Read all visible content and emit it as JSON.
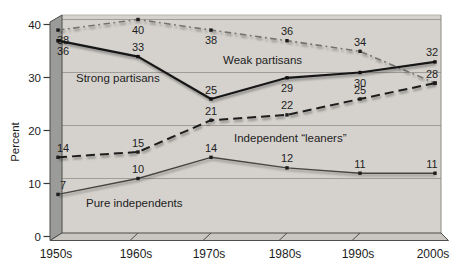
{
  "chart_data": {
    "type": "line",
    "title": "",
    "xlabel": "",
    "ylabel": "Percent",
    "categories": [
      "1950s",
      "1960s",
      "1970s",
      "1980s",
      "1990s",
      "2000s"
    ],
    "ylim": [
      0,
      40
    ],
    "yticks": [
      0,
      10,
      20,
      30,
      40
    ],
    "grid": true,
    "frame_style": "3d-textbook-panel",
    "legend_position": "inline-annotations",
    "series": [
      {
        "name": "Weak partisans",
        "style": "dash-dot",
        "color": "#72726f",
        "marker_color": "#1c1c1c",
        "values": [
          38,
          40,
          38,
          36,
          34,
          28
        ],
        "label_positions": [
          "below",
          "below",
          "below",
          "above",
          "above",
          "none"
        ]
      },
      {
        "name": "Independent “leaners”",
        "style": "dashed",
        "color": "#1f1f1d",
        "marker_color": "#1c1c1c",
        "values": [
          14,
          15,
          21,
          22,
          25,
          28
        ],
        "label_positions": [
          "above",
          "above",
          "above",
          "above",
          "above",
          "above"
        ]
      },
      {
        "name": "Pure independents",
        "style": "solid-thin",
        "color": "#454543",
        "marker_color": "#1c1c1c",
        "values": [
          7,
          10,
          14,
          12,
          11,
          11
        ],
        "label_positions": [
          "above",
          "above",
          "above",
          "above",
          "above",
          "above"
        ]
      },
      {
        "name": "Strong partisans",
        "style": "solid",
        "color": "#161616",
        "marker_color": "#111111",
        "values": [
          36,
          33,
          25,
          29,
          30,
          32
        ],
        "label_positions": [
          "below",
          "above",
          "above",
          "below",
          "below",
          "above"
        ]
      }
    ],
    "series_annotations": [
      {
        "series": 3,
        "x": 76,
        "y": 82
      },
      {
        "series": 0,
        "x": 223,
        "y": 64
      },
      {
        "series": 1,
        "x": 234,
        "y": 142
      },
      {
        "series": 2,
        "x": 86,
        "y": 207
      }
    ],
    "colors": {
      "page_bg": "#ffffff",
      "plot_bg": "#d5d2cd",
      "wall": "#9b9b99",
      "floor": "#cac7c2",
      "gridline": "#a09d98",
      "axis": "#4d4d4b",
      "right_border": "#8e8b86",
      "top_border": "#b7b4af",
      "text": "#1d1d1d"
    }
  }
}
